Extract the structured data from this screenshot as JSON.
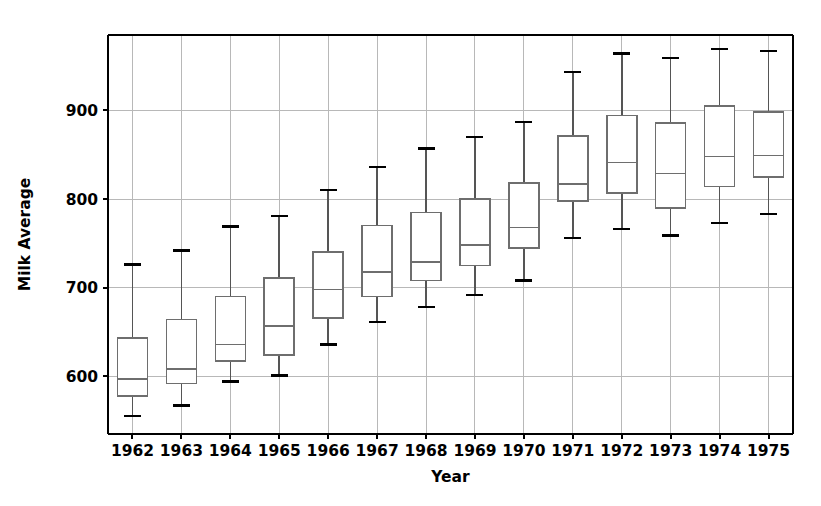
{
  "chart_data": {
    "type": "box",
    "title": "",
    "xlabel": "Year",
    "ylabel": "Milk Average",
    "categories": [
      "1962",
      "1963",
      "1964",
      "1965",
      "1966",
      "1967",
      "1968",
      "1969",
      "1970",
      "1971",
      "1972",
      "1973",
      "1974",
      "1975"
    ],
    "xlim": [
      0.5,
      14.5
    ],
    "ylim": [
      535,
      985
    ],
    "yticks": [
      600,
      700,
      800,
      900
    ],
    "ytick_labels": [
      "600",
      "700",
      "800",
      "900"
    ],
    "grid": true,
    "legend": null,
    "boxes": [
      {
        "category": "1962",
        "whisker_low": 555,
        "q1": 578,
        "median": 597,
        "q3": 643,
        "whisker_high": 726
      },
      {
        "category": "1963",
        "whisker_low": 567,
        "q1": 592,
        "median": 608,
        "q3": 664,
        "whisker_high": 742
      },
      {
        "category": "1964",
        "whisker_low": 594,
        "q1": 617,
        "median": 636,
        "q3": 690,
        "whisker_high": 769
      },
      {
        "category": "1965",
        "whisker_low": 601,
        "q1": 624,
        "median": 657,
        "q3": 711,
        "whisker_high": 781
      },
      {
        "category": "1966",
        "whisker_low": 636,
        "q1": 666,
        "median": 698,
        "q3": 740,
        "whisker_high": 810
      },
      {
        "category": "1967",
        "whisker_low": 661,
        "q1": 690,
        "median": 718,
        "q3": 770,
        "whisker_high": 836
      },
      {
        "category": "1968",
        "whisker_low": 678,
        "q1": 708,
        "median": 729,
        "q3": 785,
        "whisker_high": 857
      },
      {
        "category": "1969",
        "whisker_low": 692,
        "q1": 725,
        "median": 748,
        "q3": 800,
        "whisker_high": 870
      },
      {
        "category": "1970",
        "whisker_low": 708,
        "q1": 745,
        "median": 768,
        "q3": 818,
        "whisker_high": 887
      },
      {
        "category": "1971",
        "whisker_low": 756,
        "q1": 798,
        "median": 817,
        "q3": 871,
        "whisker_high": 943
      },
      {
        "category": "1972",
        "whisker_low": 766,
        "q1": 807,
        "median": 841,
        "q3": 894,
        "whisker_high": 964
      },
      {
        "category": "1973",
        "whisker_low": 759,
        "q1": 790,
        "median": 829,
        "q3": 886,
        "whisker_high": 959
      },
      {
        "category": "1974",
        "whisker_low": 773,
        "q1": 814,
        "median": 848,
        "q3": 905,
        "whisker_high": 969
      },
      {
        "category": "1975",
        "whisker_low": 783,
        "q1": 825,
        "median": 849,
        "q3": 898,
        "whisker_high": 967
      }
    ]
  },
  "style": {
    "background": "#ffffff",
    "axis_color": "#000000",
    "grid_color": "#b8b8b8",
    "box_edge_color": "#6e6e6e",
    "whisker_color": "#555555",
    "cap_color": "#000000",
    "median_color": "#6e6e6e",
    "box_fill": "#ffffff"
  },
  "geometry": {
    "plot_left": 108,
    "plot_right": 793,
    "plot_top": 35,
    "plot_bottom": 434,
    "box_width": 30,
    "cap_width": 17
  }
}
